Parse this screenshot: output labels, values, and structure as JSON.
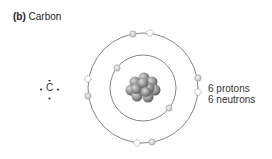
{
  "title": {
    "prefix": "(b)",
    "label": "Carbon"
  },
  "lewis": {
    "symbol": "C"
  },
  "labels": {
    "protons": "6 protons",
    "neutrons": "6 neutrons"
  },
  "colors": {
    "orbit": "#666666",
    "electron": "#cfcfcf",
    "nucleus": "#8a8a8a",
    "text": "#333333"
  }
}
